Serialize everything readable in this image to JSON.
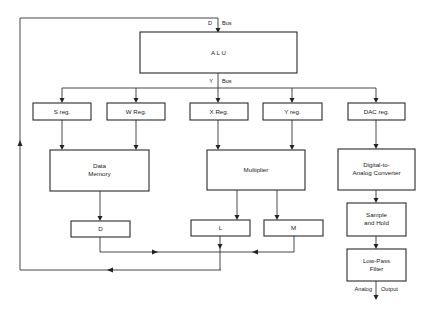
{
  "diagram": {
    "type": "block-diagram",
    "buses": {
      "d_bus": {
        "left": "D",
        "right": "Bus"
      },
      "y_bus": {
        "left": "Y",
        "right": "Bus"
      }
    },
    "blocks": {
      "alu": {
        "lines": [
          "A L U"
        ]
      },
      "s_reg": {
        "lines": [
          "S reg."
        ]
      },
      "w_reg": {
        "lines": [
          "W Reg."
        ]
      },
      "x_reg": {
        "lines": [
          "X Reg."
        ]
      },
      "y_reg": {
        "lines": [
          "Y reg."
        ]
      },
      "dac_reg": {
        "lines": [
          "DAC reg."
        ]
      },
      "data_memory": {
        "lines": [
          "Data",
          "Memory"
        ]
      },
      "multiplier": {
        "lines": [
          "Multiplier"
        ]
      },
      "dac": {
        "lines": [
          "Digital-to-",
          "Analog Converter"
        ]
      },
      "d": {
        "lines": [
          "D"
        ]
      },
      "l": {
        "lines": [
          "L"
        ]
      },
      "m": {
        "lines": [
          "M"
        ]
      },
      "sample_hold": {
        "lines": [
          "Sample",
          "and Hold"
        ]
      },
      "low_pass": {
        "lines": [
          "Low-Pass",
          "Filter"
        ]
      }
    },
    "output_label": {
      "left": "Analog",
      "right": "Output"
    },
    "connections": [
      [
        "d_bus",
        "alu"
      ],
      [
        "alu",
        "y_bus"
      ],
      [
        "y_bus",
        "s_reg"
      ],
      [
        "y_bus",
        "w_reg"
      ],
      [
        "y_bus",
        "x_reg"
      ],
      [
        "y_bus",
        "y_reg"
      ],
      [
        "y_bus",
        "dac_reg"
      ],
      [
        "s_reg",
        "data_memory"
      ],
      [
        "w_reg",
        "data_memory"
      ],
      [
        "x_reg",
        "multiplier"
      ],
      [
        "y_reg",
        "multiplier"
      ],
      [
        "dac_reg",
        "dac"
      ],
      [
        "dac",
        "sample_hold"
      ],
      [
        "sample_hold",
        "low_pass"
      ],
      [
        "low_pass",
        "analog_output"
      ],
      [
        "data_memory",
        "d"
      ],
      [
        "multiplier",
        "l"
      ],
      [
        "multiplier",
        "m"
      ],
      [
        "d",
        "d_bus"
      ],
      [
        "l",
        "d_bus"
      ],
      [
        "m",
        "d_bus"
      ]
    ]
  }
}
